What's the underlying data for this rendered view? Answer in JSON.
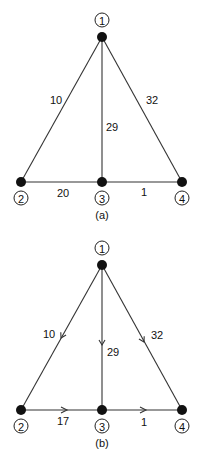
{
  "diagrams": [
    {
      "caption": "(a)",
      "directed": false,
      "nodes": [
        {
          "id": "1",
          "label": "1"
        },
        {
          "id": "2",
          "label": "2"
        },
        {
          "id": "3",
          "label": "3"
        },
        {
          "id": "4",
          "label": "4"
        }
      ],
      "edges": [
        {
          "from": "1",
          "to": "2",
          "weight": "10"
        },
        {
          "from": "1",
          "to": "3",
          "weight": "29"
        },
        {
          "from": "1",
          "to": "4",
          "weight": "32"
        },
        {
          "from": "2",
          "to": "3",
          "weight": "20"
        },
        {
          "from": "3",
          "to": "4",
          "weight": "1"
        }
      ]
    },
    {
      "caption": "(b)",
      "directed": true,
      "nodes": [
        {
          "id": "1",
          "label": "1"
        },
        {
          "id": "2",
          "label": "2"
        },
        {
          "id": "3",
          "label": "3"
        },
        {
          "id": "4",
          "label": "4"
        }
      ],
      "edges": [
        {
          "from": "1",
          "to": "2",
          "weight": "10"
        },
        {
          "from": "1",
          "to": "3",
          "weight": "29"
        },
        {
          "from": "1",
          "to": "4",
          "weight": "32"
        },
        {
          "from": "2",
          "to": "3",
          "weight": "17"
        },
        {
          "from": "3",
          "to": "4",
          "weight": "1"
        }
      ]
    }
  ]
}
